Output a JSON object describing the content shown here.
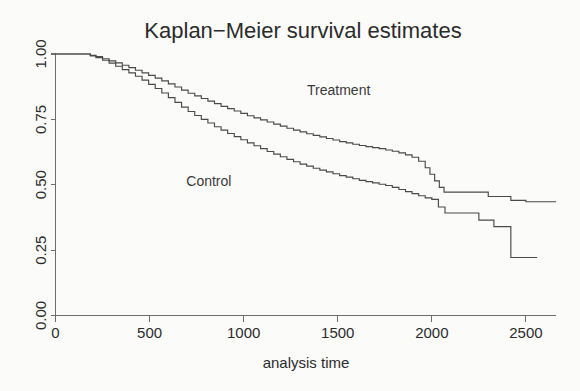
{
  "chart_data": {
    "type": "line",
    "title": "Kaplan−Meier survival estimates",
    "xlabel": "analysis time",
    "ylabel": "",
    "xlim": [
      0,
      2660
    ],
    "ylim": [
      0.0,
      1.0
    ],
    "grid": false,
    "legend_position": "inline-annotations",
    "xticks": [
      0,
      500,
      1000,
      1500,
      2000,
      2500
    ],
    "xtick_labels": [
      "0",
      "500",
      "1000",
      "1500",
      "2000",
      "2500"
    ],
    "yticks": [
      0.0,
      0.25,
      0.5,
      0.75,
      1.0
    ],
    "ytick_labels": [
      "0.00",
      "0.25",
      "0.50",
      "0.75",
      "1.00"
    ],
    "step_type": "post",
    "series": [
      {
        "name": "Treatment",
        "annotation": "Treatment",
        "annotation_x": 1505,
        "annotation_y": 0.845,
        "color": "#4a4a4a",
        "x": [
          0,
          120,
          185,
          215,
          250,
          285,
          320,
          355,
          390,
          425,
          460,
          495,
          530,
          565,
          600,
          635,
          670,
          705,
          740,
          775,
          810,
          845,
          880,
          915,
          950,
          985,
          1020,
          1055,
          1090,
          1125,
          1160,
          1195,
          1230,
          1265,
          1300,
          1335,
          1370,
          1405,
          1440,
          1475,
          1510,
          1545,
          1580,
          1615,
          1650,
          1685,
          1720,
          1755,
          1790,
          1825,
          1860,
          1895,
          1930,
          1965,
          1990,
          2015,
          2040,
          2065,
          2180,
          2300,
          2420,
          2500,
          2660
        ],
        "y": [
          1.0,
          1.0,
          0.995,
          0.99,
          0.982,
          0.974,
          0.966,
          0.957,
          0.948,
          0.938,
          0.928,
          0.918,
          0.908,
          0.897,
          0.886,
          0.874,
          0.862,
          0.85,
          0.84,
          0.83,
          0.82,
          0.81,
          0.8,
          0.791,
          0.782,
          0.773,
          0.764,
          0.756,
          0.748,
          0.74,
          0.732,
          0.724,
          0.716,
          0.709,
          0.702,
          0.695,
          0.689,
          0.683,
          0.677,
          0.671,
          0.665,
          0.66,
          0.655,
          0.65,
          0.646,
          0.642,
          0.638,
          0.633,
          0.628,
          0.622,
          0.614,
          0.605,
          0.59,
          0.565,
          0.54,
          0.515,
          0.49,
          0.472,
          0.472,
          0.455,
          0.44,
          0.435,
          0.435
        ]
      },
      {
        "name": "Control",
        "annotation": "Control",
        "annotation_x": 815,
        "annotation_y": 0.495,
        "color": "#4a4a4a",
        "x": [
          0,
          120,
          185,
          215,
          250,
          285,
          320,
          355,
          390,
          425,
          460,
          495,
          530,
          565,
          600,
          635,
          670,
          705,
          740,
          775,
          810,
          845,
          880,
          915,
          950,
          985,
          1020,
          1055,
          1090,
          1125,
          1160,
          1195,
          1230,
          1265,
          1300,
          1335,
          1370,
          1405,
          1440,
          1475,
          1510,
          1545,
          1580,
          1615,
          1650,
          1685,
          1720,
          1755,
          1790,
          1825,
          1860,
          1895,
          1930,
          1965,
          2000,
          2035,
          2070,
          2150,
          2250,
          2330,
          2400,
          2420,
          2560
        ],
        "y": [
          1.0,
          1.0,
          0.993,
          0.986,
          0.976,
          0.965,
          0.953,
          0.94,
          0.928,
          0.915,
          0.9,
          0.884,
          0.868,
          0.851,
          0.833,
          0.815,
          0.797,
          0.78,
          0.765,
          0.75,
          0.736,
          0.722,
          0.709,
          0.696,
          0.684,
          0.672,
          0.66,
          0.649,
          0.638,
          0.627,
          0.617,
          0.607,
          0.597,
          0.588,
          0.579,
          0.571,
          0.563,
          0.556,
          0.549,
          0.542,
          0.535,
          0.529,
          0.523,
          0.517,
          0.512,
          0.507,
          0.502,
          0.497,
          0.49,
          0.482,
          0.474,
          0.466,
          0.458,
          0.45,
          0.444,
          0.415,
          0.392,
          0.392,
          0.365,
          0.34,
          0.34,
          0.222,
          0.222
        ]
      }
    ]
  }
}
